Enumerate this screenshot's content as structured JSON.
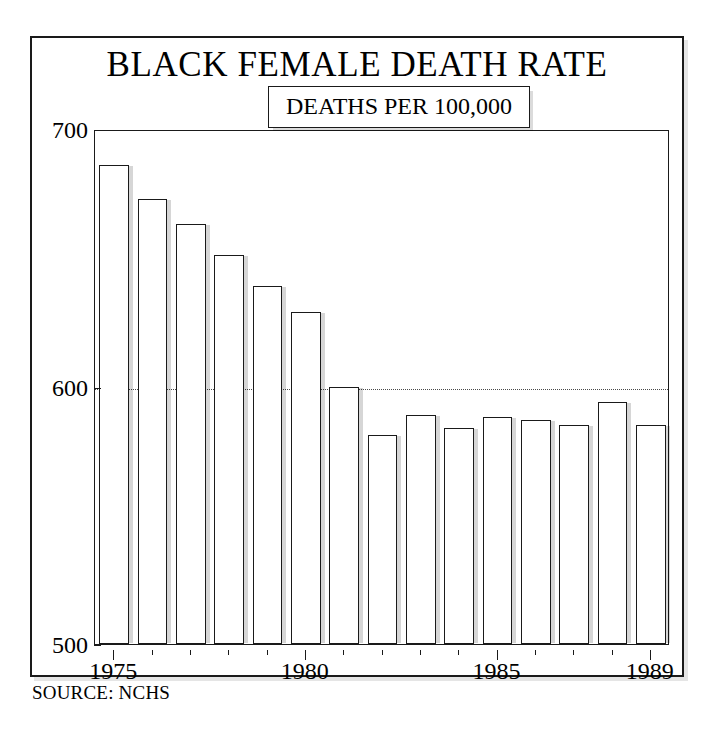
{
  "figure": {
    "title": "BLACK FEMALE DEATH RATE",
    "subtitle": "1975-1989",
    "legend_label": "DEATHS PER 100,000",
    "source_note": "SOURCE: NCHS"
  },
  "chart_data": {
    "type": "bar",
    "title": "BLACK FEMALE DEATH RATE",
    "subtitle": "1975-1989",
    "xlabel": "",
    "ylabel": "DEATHS PER 100,000",
    "categories": [
      "1975",
      "1976",
      "1977",
      "1978",
      "1979",
      "1980",
      "1981",
      "1982",
      "1983",
      "1984",
      "1985",
      "1986",
      "1987",
      "1988",
      "1989"
    ],
    "values": [
      686,
      673,
      663,
      651,
      639,
      629,
      600,
      581,
      589,
      584,
      588,
      587,
      585,
      594,
      585
    ],
    "ylim": [
      500,
      700
    ],
    "ytick_labels": [
      "700",
      "600",
      "500"
    ],
    "ytick_values": [
      700,
      600,
      500
    ],
    "xtick_labels": [
      "1975",
      "1980",
      "1985",
      "1989"
    ],
    "xtick_values": [
      1975,
      1980,
      1985,
      1989
    ],
    "gridlines": [
      600
    ],
    "grid": "horizontal-dotted-at-600",
    "legend": "none",
    "annotation": "DEATHS PER 100,000",
    "bar_fill": "#ffffff",
    "bar_edge": "#1a1a1a",
    "bar_shadow": "#cccccc"
  }
}
